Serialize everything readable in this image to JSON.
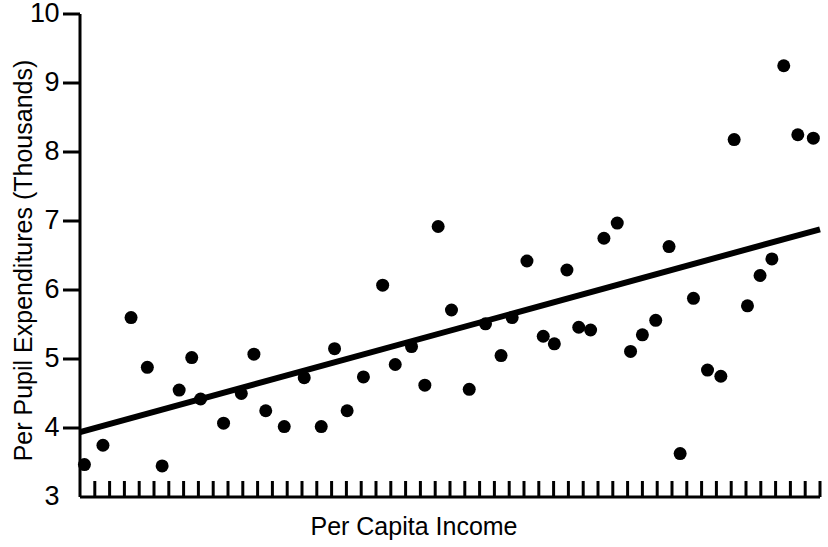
{
  "chart_data": {
    "type": "scatter",
    "title": "",
    "xlabel": "Per Capita Income",
    "ylabel": "Per Pupil Expenditures (Thousands)",
    "ylim": [
      3,
      10
    ],
    "yticks": [
      3,
      4,
      5,
      6,
      7,
      8,
      9,
      10
    ],
    "ytick_labels": [
      "3",
      "4",
      "5",
      "6",
      "7",
      "8",
      "9",
      "10"
    ],
    "xlim": [
      0,
      100
    ],
    "x_tick_count": 50,
    "x_tick_labels": [],
    "grid": false,
    "legend": null,
    "marker_color": "#000000",
    "marker_size_px": 13,
    "line_color": "#000000",
    "line_width_px": 6,
    "axis_color": "#000000",
    "background_color": "#ffffff",
    "points": [
      {
        "x": 0.6,
        "y": 3.47
      },
      {
        "x": 3.1,
        "y": 3.75
      },
      {
        "x": 6.9,
        "y": 5.6
      },
      {
        "x": 9.1,
        "y": 4.88
      },
      {
        "x": 11.1,
        "y": 3.45
      },
      {
        "x": 13.4,
        "y": 4.55
      },
      {
        "x": 15.1,
        "y": 5.02
      },
      {
        "x": 16.3,
        "y": 4.42
      },
      {
        "x": 19.4,
        "y": 4.07
      },
      {
        "x": 21.8,
        "y": 4.5
      },
      {
        "x": 23.5,
        "y": 5.07
      },
      {
        "x": 25.1,
        "y": 4.25
      },
      {
        "x": 27.6,
        "y": 4.02
      },
      {
        "x": 30.3,
        "y": 4.73
      },
      {
        "x": 32.6,
        "y": 4.02
      },
      {
        "x": 34.4,
        "y": 5.15
      },
      {
        "x": 36.1,
        "y": 4.25
      },
      {
        "x": 38.3,
        "y": 4.74
      },
      {
        "x": 40.9,
        "y": 6.07
      },
      {
        "x": 42.6,
        "y": 4.92
      },
      {
        "x": 44.8,
        "y": 5.18
      },
      {
        "x": 46.6,
        "y": 4.62
      },
      {
        "x": 48.4,
        "y": 6.92
      },
      {
        "x": 50.2,
        "y": 5.71
      },
      {
        "x": 52.6,
        "y": 4.56
      },
      {
        "x": 54.8,
        "y": 5.51
      },
      {
        "x": 56.9,
        "y": 5.05
      },
      {
        "x": 58.4,
        "y": 5.6
      },
      {
        "x": 60.4,
        "y": 6.42
      },
      {
        "x": 62.6,
        "y": 5.33
      },
      {
        "x": 64.1,
        "y": 5.22
      },
      {
        "x": 65.8,
        "y": 6.29
      },
      {
        "x": 67.4,
        "y": 5.46
      },
      {
        "x": 69.0,
        "y": 5.42
      },
      {
        "x": 70.8,
        "y": 6.75
      },
      {
        "x": 72.6,
        "y": 6.97
      },
      {
        "x": 74.4,
        "y": 5.11
      },
      {
        "x": 76.0,
        "y": 5.35
      },
      {
        "x": 77.8,
        "y": 5.56
      },
      {
        "x": 79.6,
        "y": 6.63
      },
      {
        "x": 81.1,
        "y": 3.63
      },
      {
        "x": 82.9,
        "y": 5.88
      },
      {
        "x": 84.8,
        "y": 4.84
      },
      {
        "x": 86.6,
        "y": 4.75
      },
      {
        "x": 88.4,
        "y": 8.18
      },
      {
        "x": 90.2,
        "y": 5.77
      },
      {
        "x": 91.9,
        "y": 6.21
      },
      {
        "x": 93.5,
        "y": 6.45
      },
      {
        "x": 95.1,
        "y": 9.25
      },
      {
        "x": 97.0,
        "y": 8.25
      },
      {
        "x": 99.1,
        "y": 8.2
      }
    ],
    "trend_line": {
      "x_start": 0,
      "y_start": 3.94,
      "x_end": 100,
      "y_end": 6.88
    }
  }
}
